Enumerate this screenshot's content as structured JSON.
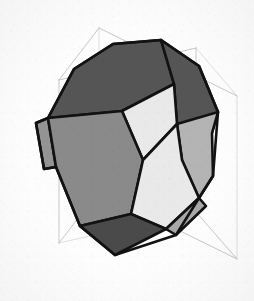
{
  "figure": {
    "kind": "3d-polyhedron-wireframe-render",
    "caption": "",
    "background_color": "#fdfdfd",
    "canvas": {
      "width": 254,
      "height": 301
    }
  },
  "palette": {
    "face_dark": "#555555",
    "face_mid": "#8a8a8a",
    "face_light": "#e9e9e9",
    "face_midlight": "#b4b4b4",
    "face_darkest": "#4a4a4a",
    "edge_color": "#121212",
    "box_line_color": "#b9b9b9",
    "box_line_faint": "#d6d6d6",
    "background_color": "#fdfdfd"
  },
  "bounding_box": {
    "name": "wireframe-cube",
    "stroke_width": 0.8,
    "vertices": {
      "front_top_left": [
        59,
        80
      ],
      "front_top_right": [
        196,
        48
      ],
      "back_top_right": [
        237,
        96
      ],
      "back_top_left": [
        99,
        28
      ],
      "front_bottom_left": [
        59,
        243
      ],
      "front_bottom_right": [
        196,
        212
      ],
      "back_bottom_right": [
        237,
        259
      ],
      "back_bottom_left": [
        99,
        191
      ]
    },
    "edges": [
      [
        "back_top_left",
        "front_top_left"
      ],
      [
        "front_top_left",
        "front_top_right"
      ],
      [
        "front_top_right",
        "back_top_right"
      ],
      [
        "back_top_right",
        "back_top_left"
      ],
      [
        "back_bottom_left",
        "front_bottom_left"
      ],
      [
        "front_bottom_left",
        "front_bottom_right"
      ],
      [
        "front_bottom_right",
        "back_bottom_right"
      ],
      [
        "back_bottom_right",
        "back_bottom_left"
      ],
      [
        "back_top_left",
        "back_bottom_left"
      ],
      [
        "front_top_left",
        "front_bottom_left"
      ],
      [
        "front_top_right",
        "front_bottom_right"
      ],
      [
        "back_top_right",
        "back_bottom_right"
      ]
    ]
  },
  "polyhedron": {
    "name": "truncated-octahedron",
    "edge_stroke_width": 2.6,
    "faces": [
      {
        "id": "top-hexagon-left",
        "shape": "hexagon",
        "shade": "dark",
        "fill": "#555555",
        "points": "48,118 74,69 113,44 161,40 174,84 122,111"
      },
      {
        "id": "top-hexagon-right",
        "shape": "hexagon",
        "shade": "dark",
        "fill": "#555555",
        "points": "161,40 199,66 218,112 212,133 177,124 174,84"
      },
      {
        "id": "right-upper-hexagon",
        "shape": "hexagon",
        "shade": "midlight",
        "fill": "#b4b4b4",
        "points": "218,112 212,133 213,176 199,198 182,160 177,124"
      },
      {
        "id": "left-sliver-face",
        "shape": "quadrilateral",
        "shade": "mid",
        "fill": "#949494",
        "points": "36,123 48,118 56,167 44,169"
      },
      {
        "id": "center-square",
        "shape": "square",
        "shade": "light",
        "fill": "#e9e9e9",
        "points": "122,111 174,84 177,124 143,160"
      },
      {
        "id": "left-large-hexagon",
        "shape": "hexagon",
        "shade": "mid",
        "fill": "#8a8a8a",
        "points": "48,118 122,111 143,160 131,214 80,226 56,167"
      },
      {
        "id": "right-large-hexagon",
        "shape": "hexagon",
        "shade": "light",
        "fill": "#e9e9e9",
        "points": "143,160 177,124 182,160 199,198 166,229 131,214"
      },
      {
        "id": "bottom-square",
        "shape": "square",
        "shade": "darkest",
        "fill": "#4a4a4a",
        "points": "80,226 131,214 166,229 115,255"
      },
      {
        "id": "bottom-right-sliver",
        "shape": "quadrilateral",
        "shade": "midlight",
        "fill": "#a8a8a8",
        "points": "166,229 199,198 206,206 176,235"
      }
    ],
    "silhouette": "36,123 48,118 74,69 113,44 161,40 199,66 218,112 213,176 199,198 176,235 115,255 80,226 56,167 44,169"
  }
}
